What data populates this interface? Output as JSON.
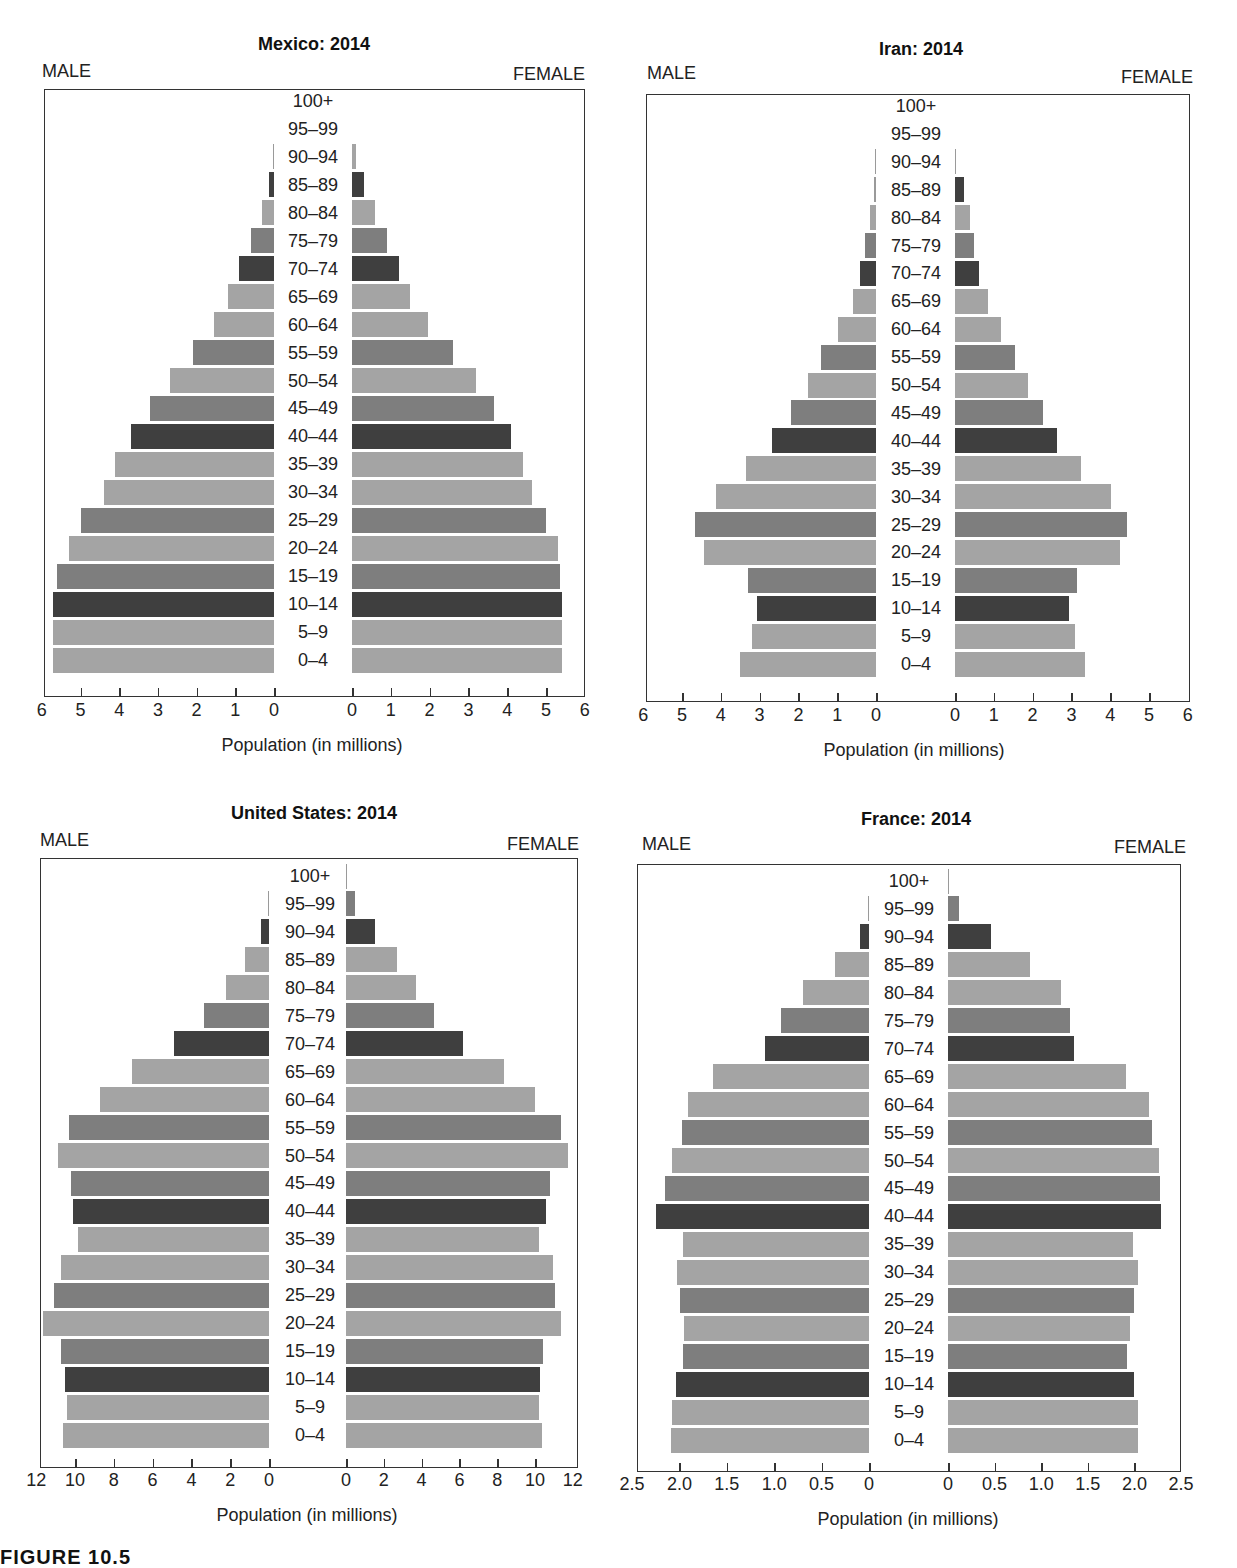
{
  "age_groups": [
    "0–4",
    "5–9",
    "10–14",
    "15–19",
    "20–24",
    "25–29",
    "30–34",
    "35–39",
    "40–44",
    "45–49",
    "50–54",
    "55–59",
    "60–64",
    "65–69",
    "70–74",
    "75–79",
    "80–84",
    "85–89",
    "90–94",
    "95–99",
    "100+"
  ],
  "labels": {
    "male": "MALE",
    "female": "FEMALE",
    "xlabel": "Population (in millions)"
  },
  "caption": "FIGURE 10.5",
  "colors": {
    "light": "#a4a4a4",
    "medium": "#7e7e7e",
    "dark": "#3f3f3f"
  },
  "chart_data": [
    {
      "type": "bar",
      "subtype": "population-pyramid",
      "title": "Mexico: 2014",
      "xlabel": "Population (in millions)",
      "ylabel": "",
      "categories": [
        "0–4",
        "5–9",
        "10–14",
        "15–19",
        "20–24",
        "25–29",
        "30–34",
        "35–39",
        "40–44",
        "45–49",
        "50–54",
        "55–59",
        "60–64",
        "65–69",
        "70–74",
        "75–79",
        "80–84",
        "85–89",
        "90–94",
        "95–99",
        "100+"
      ],
      "xlim": [
        0,
        6
      ],
      "ticks": [
        "0",
        "1",
        "2",
        "3",
        "4",
        "5",
        "6"
      ],
      "series": [
        {
          "name": "MALE",
          "values": [
            5.7,
            5.7,
            5.7,
            5.6,
            5.3,
            5.0,
            4.4,
            4.1,
            3.7,
            3.2,
            2.7,
            2.1,
            1.55,
            1.2,
            0.9,
            0.6,
            0.3,
            0.13,
            0.02,
            0,
            0
          ]
        },
        {
          "name": "FEMALE",
          "values": [
            5.4,
            5.4,
            5.4,
            5.35,
            5.3,
            5.0,
            4.65,
            4.4,
            4.1,
            3.65,
            3.2,
            2.6,
            1.95,
            1.5,
            1.2,
            0.9,
            0.6,
            0.3,
            0.1,
            0,
            0
          ]
        }
      ],
      "shades": [
        "light",
        "light",
        "dark",
        "medium",
        "light",
        "medium",
        "light",
        "light",
        "dark",
        "medium",
        "light",
        "medium",
        "light",
        "light",
        "dark",
        "medium",
        "light",
        "dark",
        "light",
        "light",
        "light"
      ],
      "grid": false,
      "legend": "none"
    },
    {
      "type": "bar",
      "subtype": "population-pyramid",
      "title": "Iran: 2014",
      "xlabel": "Population (in millions)",
      "ylabel": "",
      "categories": [
        "0–4",
        "5–9",
        "10–14",
        "15–19",
        "20–24",
        "25–29",
        "30–34",
        "35–39",
        "40–44",
        "45–49",
        "50–54",
        "55–59",
        "60–64",
        "65–69",
        "70–74",
        "75–79",
        "80–84",
        "85–89",
        "90–94",
        "95–99",
        "100+"
      ],
      "xlim": [
        0,
        6
      ],
      "ticks": [
        "0",
        "1",
        "2",
        "3",
        "4",
        "5",
        "6"
      ],
      "series": [
        {
          "name": "MALE",
          "values": [
            3.5,
            3.2,
            3.07,
            3.3,
            4.43,
            4.67,
            4.12,
            3.35,
            2.68,
            2.2,
            1.75,
            1.42,
            0.98,
            0.6,
            0.42,
            0.28,
            0.15,
            0.05,
            0.01,
            0,
            0
          ]
        },
        {
          "name": "FEMALE",
          "values": [
            3.35,
            3.1,
            2.93,
            3.15,
            4.25,
            4.43,
            4.02,
            3.25,
            2.63,
            2.27,
            1.88,
            1.55,
            1.18,
            0.85,
            0.62,
            0.5,
            0.38,
            0.22,
            0.02,
            0,
            0
          ]
        }
      ],
      "shades": [
        "light",
        "light",
        "dark",
        "medium",
        "light",
        "medium",
        "light",
        "light",
        "dark",
        "medium",
        "light",
        "medium",
        "light",
        "light",
        "dark",
        "medium",
        "light",
        "dark",
        "light",
        "light",
        "light"
      ],
      "grid": false,
      "legend": "none"
    },
    {
      "type": "bar",
      "subtype": "population-pyramid",
      "title": "United States: 2014",
      "xlabel": "Population (in millions)",
      "ylabel": "",
      "categories": [
        "0–4",
        "5–9",
        "10–14",
        "15–19",
        "20–24",
        "25–29",
        "30–34",
        "35–39",
        "40–44",
        "45–49",
        "50–54",
        "55–59",
        "60–64",
        "65–69",
        "70–74",
        "75–79",
        "80–84",
        "85–89",
        "90–94",
        "95–99",
        "100+"
      ],
      "xlim": [
        0,
        12
      ],
      "ticks": [
        "0",
        "2",
        "4",
        "6",
        "8",
        "10",
        "12"
      ],
      "series": [
        {
          "name": "MALE",
          "values": [
            10.6,
            10.4,
            10.5,
            10.7,
            11.65,
            11.1,
            10.7,
            9.85,
            10.1,
            10.2,
            10.9,
            10.3,
            8.7,
            7.05,
            4.9,
            3.35,
            2.2,
            1.25,
            0.4,
            0.05,
            0
          ]
        },
        {
          "name": "FEMALE",
          "values": [
            10.35,
            10.2,
            10.25,
            10.4,
            11.35,
            11.05,
            10.95,
            10.2,
            10.6,
            10.8,
            11.75,
            11.35,
            10.0,
            8.35,
            6.2,
            4.65,
            3.7,
            2.7,
            1.55,
            0.5,
            0.05
          ]
        }
      ],
      "shades": [
        "light",
        "light",
        "dark",
        "medium",
        "light",
        "medium",
        "light",
        "light",
        "dark",
        "medium",
        "light",
        "medium",
        "light",
        "light",
        "dark",
        "medium",
        "light",
        "light",
        "dark",
        "medium",
        "light"
      ],
      "grid": false,
      "legend": "none"
    },
    {
      "type": "bar",
      "subtype": "population-pyramid",
      "title": "France: 2014",
      "xlabel": "Population (in millions)",
      "ylabel": "",
      "categories": [
        "0–4",
        "5–9",
        "10–14",
        "15–19",
        "20–24",
        "25–29",
        "30–34",
        "35–39",
        "40–44",
        "45–49",
        "50–54",
        "55–59",
        "60–64",
        "65–69",
        "70–74",
        "75–79",
        "80–84",
        "85–89",
        "90–94",
        "95–99",
        "100+"
      ],
      "xlim": [
        0,
        2.5
      ],
      "ticks": [
        "0",
        "0.5",
        "1.0",
        "1.5",
        "2.0",
        "2.5"
      ],
      "series": [
        {
          "name": "MALE",
          "values": [
            2.09,
            2.08,
            2.04,
            1.96,
            1.95,
            1.99,
            2.03,
            1.96,
            2.25,
            2.15,
            2.08,
            1.97,
            1.91,
            1.65,
            1.1,
            0.93,
            0.7,
            0.36,
            0.1,
            0.01,
            0
          ]
        },
        {
          "name": "FEMALE",
          "values": [
            2.04,
            2.04,
            2.0,
            1.92,
            1.95,
            2.0,
            2.04,
            1.98,
            2.29,
            2.27,
            2.26,
            2.19,
            2.16,
            1.91,
            1.35,
            1.31,
            1.21,
            0.88,
            0.46,
            0.12,
            0.01
          ]
        }
      ],
      "shades": [
        "light",
        "light",
        "dark",
        "medium",
        "light",
        "medium",
        "light",
        "light",
        "dark",
        "medium",
        "light",
        "medium",
        "light",
        "light",
        "dark",
        "medium",
        "light",
        "light",
        "dark",
        "medium",
        "light"
      ],
      "grid": false,
      "legend": "none"
    }
  ]
}
